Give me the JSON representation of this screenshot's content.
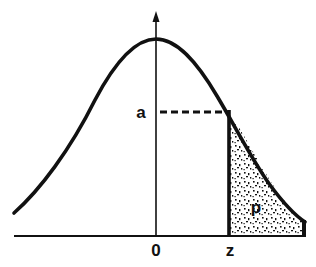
{
  "diagram": {
    "type": "normal-distribution-tail-area",
    "labels": {
      "ordinate": "a",
      "origin": "0",
      "cutoff": "z",
      "area": "p"
    },
    "colors": {
      "ink": "#111111",
      "background": "#ffffff",
      "stipple": "#111111"
    }
  }
}
